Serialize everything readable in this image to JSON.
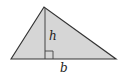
{
  "diagram": {
    "shape": "triangle",
    "fill_color": "#d6d6d6",
    "stroke_color": "#333333",
    "labels": {
      "height": "h",
      "base": "b"
    },
    "right_angle_marker": true
  }
}
